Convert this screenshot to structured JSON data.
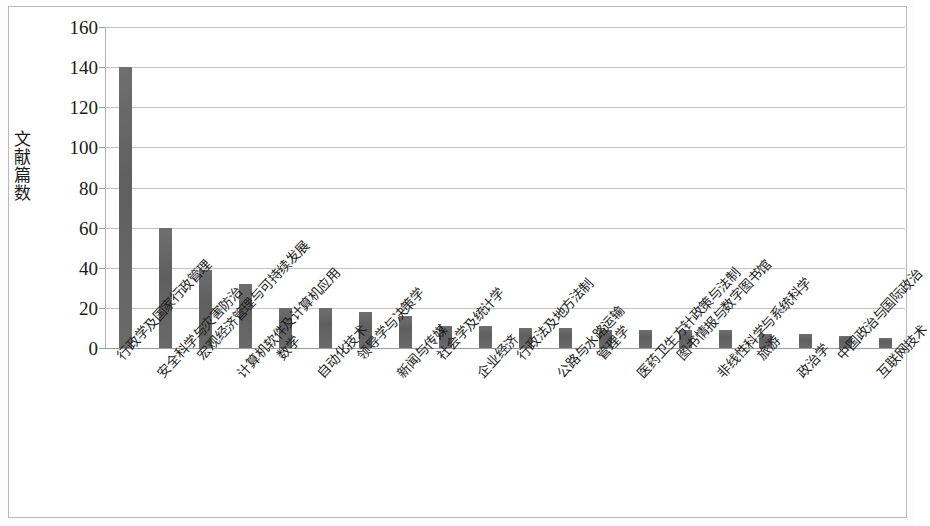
{
  "chart_data": {
    "type": "bar",
    "title": "",
    "subtitle": "",
    "xlabel": "",
    "ylabel": "文献篇数",
    "ylim": [
      0,
      160
    ],
    "ytick_step": 20,
    "yticks": [
      160,
      140,
      120,
      100,
      80,
      60,
      40,
      20,
      0
    ],
    "grid": true,
    "legend": false,
    "legend_position": "none",
    "bar_color": "#686868",
    "categories": [
      "行政学及国家行政管理",
      "安全科学与灾害防治",
      "宏观经济管理与可持续发展",
      "计算机软件及计算机应用",
      "数学",
      "自动化技术",
      "领导学与决策学",
      "新闻与传媒",
      "社会学及统计学",
      "企业经济",
      "行政法及地方法制",
      "公路与水路运输",
      "管理学",
      "医药卫生方针政策与法制",
      "图书情报与数字图书馆",
      "非线性科学与系统科学",
      "旅游",
      "政治学",
      "中国政治与国际政治",
      "互联网技术"
    ],
    "values": [
      140,
      60,
      39,
      32,
      20,
      20,
      18,
      16,
      11,
      11,
      10,
      10,
      9,
      9,
      9,
      9,
      7,
      7,
      6,
      5
    ]
  },
  "axis": {
    "y_title": "文献篇数",
    "y_tick_labels": [
      "160",
      "140",
      "120",
      "100",
      "80",
      "60",
      "40",
      "20",
      "0"
    ]
  }
}
